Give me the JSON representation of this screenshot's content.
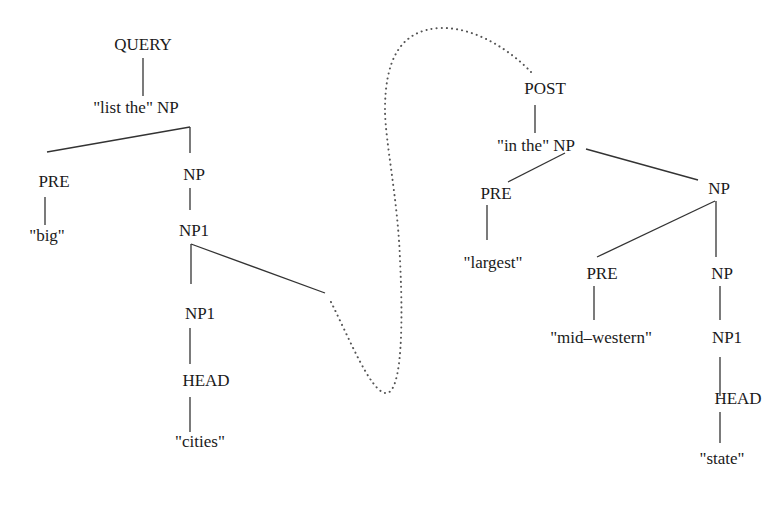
{
  "diagram": {
    "left_tree": {
      "root": "QUERY",
      "np_top": "\"list the\" NP",
      "pre": "PRE",
      "pre_word": "\"big\"",
      "np": "NP",
      "np1_a": "NP1",
      "np1_b": "NP1",
      "head": "HEAD",
      "head_word": "\"cities\""
    },
    "right_tree": {
      "root": "POST",
      "np_top": "\"in the\" NP",
      "pre": "PRE",
      "pre_word": "\"largest\"",
      "np": "NP",
      "pre2": "PRE",
      "pre2_word": "\"mid–western\"",
      "np2": "NP",
      "np1": "NP1",
      "head": "HEAD",
      "head_word": "\"state\""
    },
    "connector": {
      "style": "dotted",
      "from": "NP1 (left tree)",
      "to": "POST"
    },
    "colors": {
      "line": "#333333",
      "text": "#1a1a1a",
      "dots": "#555555"
    }
  }
}
